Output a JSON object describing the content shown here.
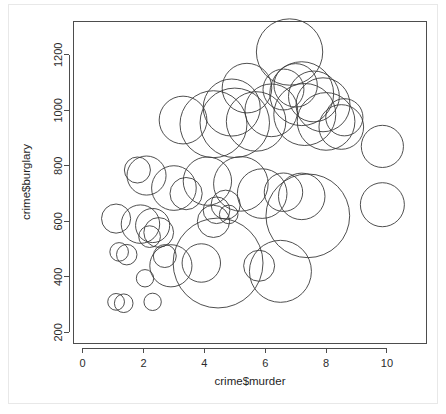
{
  "figure": {
    "title": "",
    "background_color": "#ffffff",
    "card_border_color": "#e8e8e8",
    "axis_color": "#4d4d4d",
    "bubble_stroke_color": "#3b3b3b"
  },
  "chart_data": {
    "type": "scatter",
    "title": "",
    "xlabel": "crime$murder",
    "ylabel": "crime$burglary",
    "xlim": [
      -0.3,
      11.3
    ],
    "ylim": [
      160,
      1320
    ],
    "grid": false,
    "legend": null,
    "marker": "open-circle-variable-size",
    "size_encoding": "bubble radius proportional to a third variable",
    "xticks": [
      0,
      2,
      4,
      6,
      8,
      10
    ],
    "xticklabels": [
      "0",
      "2",
      "4",
      "6",
      "8",
      "10"
    ],
    "yticks": [
      200,
      400,
      600,
      800,
      1000,
      1200
    ],
    "yticklabels": [
      "200",
      "400",
      "600",
      "800",
      "1000",
      "1200"
    ],
    "n_points": 50,
    "x_name": "murder",
    "y_name": "burglary",
    "r_name": "size",
    "points": [
      {
        "x": 6.8,
        "y": 1210,
        "r": 1.07
      },
      {
        "x": 7.2,
        "y": 1060,
        "r": 1.03
      },
      {
        "x": 7.6,
        "y": 1050,
        "r": 0.82
      },
      {
        "x": 7.9,
        "y": 1020,
        "r": 0.87
      },
      {
        "x": 7.3,
        "y": 985,
        "r": 1.0
      },
      {
        "x": 8.0,
        "y": 960,
        "r": 0.93
      },
      {
        "x": 8.6,
        "y": 975,
        "r": 0.6
      },
      {
        "x": 8.5,
        "y": 940,
        "r": 0.72
      },
      {
        "x": 9.85,
        "y": 870,
        "r": 0.68
      },
      {
        "x": 9.85,
        "y": 660,
        "r": 0.71
      },
      {
        "x": 3.3,
        "y": 965,
        "r": 0.77
      },
      {
        "x": 4.3,
        "y": 950,
        "r": 1.08
      },
      {
        "x": 5.0,
        "y": 955,
        "r": 1.12
      },
      {
        "x": 5.7,
        "y": 960,
        "r": 0.96
      },
      {
        "x": 6.2,
        "y": 1000,
        "r": 0.85
      },
      {
        "x": 4.9,
        "y": 1010,
        "r": 0.92
      },
      {
        "x": 5.4,
        "y": 1080,
        "r": 0.8
      },
      {
        "x": 6.6,
        "y": 1075,
        "r": 0.66
      },
      {
        "x": 7.0,
        "y": 1090,
        "r": 0.7
      },
      {
        "x": 1.8,
        "y": 785,
        "r": 0.42
      },
      {
        "x": 2.1,
        "y": 765,
        "r": 0.63
      },
      {
        "x": 3.0,
        "y": 720,
        "r": 0.72
      },
      {
        "x": 3.4,
        "y": 700,
        "r": 0.52
      },
      {
        "x": 4.1,
        "y": 745,
        "r": 0.78
      },
      {
        "x": 5.2,
        "y": 735,
        "r": 0.88
      },
      {
        "x": 5.9,
        "y": 700,
        "r": 0.8
      },
      {
        "x": 6.6,
        "y": 705,
        "r": 0.62
      },
      {
        "x": 7.2,
        "y": 690,
        "r": 0.75
      },
      {
        "x": 7.4,
        "y": 620,
        "r": 1.35
      },
      {
        "x": 4.7,
        "y": 660,
        "r": 0.47
      },
      {
        "x": 4.4,
        "y": 640,
        "r": 0.43
      },
      {
        "x": 4.8,
        "y": 625,
        "r": 0.3
      },
      {
        "x": 4.3,
        "y": 600,
        "r": 0.52
      },
      {
        "x": 1.1,
        "y": 610,
        "r": 0.47
      },
      {
        "x": 1.9,
        "y": 590,
        "r": 0.62
      },
      {
        "x": 2.3,
        "y": 585,
        "r": 0.55
      },
      {
        "x": 2.5,
        "y": 560,
        "r": 0.48
      },
      {
        "x": 2.2,
        "y": 545,
        "r": 0.35
      },
      {
        "x": 1.2,
        "y": 490,
        "r": 0.3
      },
      {
        "x": 1.45,
        "y": 480,
        "r": 0.33
      },
      {
        "x": 2.7,
        "y": 475,
        "r": 0.37
      },
      {
        "x": 2.9,
        "y": 440,
        "r": 0.68
      },
      {
        "x": 3.9,
        "y": 450,
        "r": 0.62
      },
      {
        "x": 4.45,
        "y": 450,
        "r": 1.45
      },
      {
        "x": 5.8,
        "y": 440,
        "r": 0.5
      },
      {
        "x": 6.5,
        "y": 420,
        "r": 1.0
      },
      {
        "x": 2.05,
        "y": 395,
        "r": 0.28
      },
      {
        "x": 1.1,
        "y": 310,
        "r": 0.27
      },
      {
        "x": 1.35,
        "y": 305,
        "r": 0.3
      },
      {
        "x": 2.3,
        "y": 310,
        "r": 0.28
      }
    ]
  }
}
